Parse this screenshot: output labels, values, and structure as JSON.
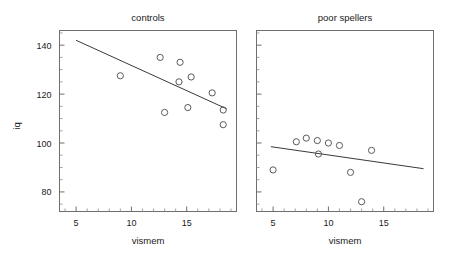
{
  "figure": {
    "ylabel": "iq",
    "panels": [
      {
        "title": "controls",
        "xlabel": "vismem"
      },
      {
        "title": "poor spellers",
        "xlabel": "vismem"
      }
    ]
  },
  "chart_data": {
    "type": "scatter",
    "title": "",
    "ylabel": "iq",
    "xlabel": "vismem",
    "xlim": [
      3.5,
      19.5
    ],
    "ylim": [
      72,
      146
    ],
    "yticks": [
      80,
      100,
      120,
      140
    ],
    "yticklabels": [
      "80",
      "100",
      "120",
      "140"
    ],
    "xticks": [
      5,
      10,
      15
    ],
    "xticklabels": [
      "5",
      "10",
      "15"
    ],
    "y_minor_tick_step": 5,
    "x_minor_tick_step": 1,
    "grid": false,
    "legend": null,
    "marker": "open-circle",
    "panels": [
      {
        "name": "controls",
        "title": "controls",
        "xlabel": "vismem",
        "ylabel": "iq",
        "y_tick_labels_shown": true,
        "points": [
          {
            "x": 9.0,
            "y": 127.5
          },
          {
            "x": 12.6,
            "y": 135.0
          },
          {
            "x": 13.0,
            "y": 112.5
          },
          {
            "x": 14.4,
            "y": 133.0
          },
          {
            "x": 14.3,
            "y": 125.0
          },
          {
            "x": 15.4,
            "y": 127.0
          },
          {
            "x": 15.1,
            "y": 114.5
          },
          {
            "x": 17.3,
            "y": 120.5
          },
          {
            "x": 18.3,
            "y": 113.5
          },
          {
            "x": 18.3,
            "y": 107.5
          }
        ],
        "fit_line": {
          "x1": 5.0,
          "y1": 142.0,
          "x2": 18.6,
          "y2": 114.0
        }
      },
      {
        "name": "poor spellers",
        "title": "poor spellers",
        "xlabel": "vismem",
        "ylabel": "iq",
        "y_tick_labels_shown": false,
        "points": [
          {
            "x": 5.0,
            "y": 89.0
          },
          {
            "x": 7.1,
            "y": 100.5
          },
          {
            "x": 8.0,
            "y": 102.0
          },
          {
            "x": 9.0,
            "y": 101.0
          },
          {
            "x": 9.1,
            "y": 95.5
          },
          {
            "x": 10.0,
            "y": 100.0
          },
          {
            "x": 11.0,
            "y": 99.0
          },
          {
            "x": 12.0,
            "y": 88.0
          },
          {
            "x": 13.0,
            "y": 76.0
          },
          {
            "x": 13.9,
            "y": 97.0
          }
        ],
        "fit_line": {
          "x1": 4.8,
          "y1": 98.5,
          "x2": 18.6,
          "y2": 89.5
        }
      }
    ]
  }
}
